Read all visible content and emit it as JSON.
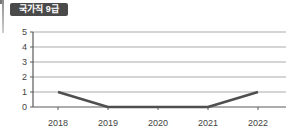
{
  "badge": {
    "label": "국가직 9급",
    "bg_color": "#4a4a4a",
    "text_color": "#ffffff"
  },
  "chart_data": {
    "type": "line",
    "title": "국가직 9급",
    "categories": [
      "2018",
      "2019",
      "2020",
      "2021",
      "2022"
    ],
    "values": [
      1,
      0,
      0,
      0,
      1
    ],
    "xlabel": "",
    "ylabel": "",
    "ylim": [
      0,
      5
    ],
    "yticks": [
      0,
      1,
      2,
      3,
      4,
      5
    ],
    "grid": true,
    "legend": false,
    "colors": {
      "line": "#4f4f4f",
      "grid": "#ababab",
      "axis": "#5a5a5a",
      "tick_label": "#3f3f3f"
    }
  }
}
